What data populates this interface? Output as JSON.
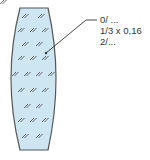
{
  "diagram": {
    "fill_color": "#cde6f2",
    "stroke_color": "#555555",
    "hatch_symbol": "⫽",
    "annotation": {
      "lines": [
        "0/ ...",
        "1/3 x 0,16",
        "2/..."
      ]
    }
  }
}
